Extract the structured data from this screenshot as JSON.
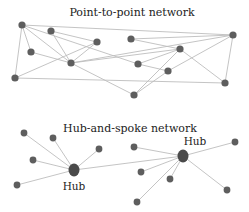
{
  "colors": {
    "node": "#5e5e5e",
    "hub": "#4a4a4a",
    "edge": "#bdbdbd",
    "text": "#222222"
  },
  "point_to_point": {
    "title": "Point-to-point network",
    "nodes": [
      {
        "id": "A",
        "x": 22,
        "y": 25
      },
      {
        "id": "B",
        "x": 51,
        "y": 31
      },
      {
        "id": "C",
        "x": 97,
        "y": 42
      },
      {
        "id": "D",
        "x": 131,
        "y": 39
      },
      {
        "id": "E",
        "x": 233,
        "y": 35
      },
      {
        "id": "F",
        "x": 31,
        "y": 52
      },
      {
        "id": "G",
        "x": 71,
        "y": 63
      },
      {
        "id": "H",
        "x": 180,
        "y": 49
      },
      {
        "id": "I",
        "x": 138,
        "y": 64
      },
      {
        "id": "J",
        "x": 168,
        "y": 71
      },
      {
        "id": "K",
        "x": 15,
        "y": 78
      },
      {
        "id": "L",
        "x": 225,
        "y": 83
      },
      {
        "id": "M",
        "x": 134,
        "y": 95
      }
    ],
    "edges": [
      [
        "A",
        "E"
      ],
      [
        "A",
        "F"
      ],
      [
        "A",
        "K"
      ],
      [
        "A",
        "G"
      ],
      [
        "A",
        "I"
      ],
      [
        "B",
        "C"
      ],
      [
        "B",
        "G"
      ],
      [
        "C",
        "G"
      ],
      [
        "C",
        "K"
      ],
      [
        "D",
        "H"
      ],
      [
        "D",
        "E"
      ],
      [
        "F",
        "G"
      ],
      [
        "G",
        "H"
      ],
      [
        "G",
        "M"
      ],
      [
        "G",
        "E"
      ],
      [
        "H",
        "I"
      ],
      [
        "H",
        "M"
      ],
      [
        "H",
        "L"
      ],
      [
        "I",
        "J"
      ],
      [
        "J",
        "E"
      ],
      [
        "J",
        "M"
      ],
      [
        "K",
        "L"
      ],
      [
        "E",
        "L"
      ]
    ]
  },
  "hub_and_spoke": {
    "title": "Hub-and-spoke network",
    "hubs": [
      {
        "id": "H1",
        "label": "Hub",
        "x": 74,
        "y": 170,
        "label_x": 74,
        "label_y": 190
      },
      {
        "id": "H2",
        "label": "Hub",
        "x": 183,
        "y": 156,
        "label_x": 195,
        "label_y": 145
      }
    ],
    "spokes": [
      {
        "hub": "H1",
        "x": 24,
        "y": 133
      },
      {
        "hub": "H1",
        "x": 53,
        "y": 138
      },
      {
        "hub": "H1",
        "x": 99,
        "y": 149
      },
      {
        "hub": "H1",
        "x": 33,
        "y": 160
      },
      {
        "hub": "H1",
        "x": 17,
        "y": 185
      },
      {
        "hub": "H2",
        "x": 134,
        "y": 147
      },
      {
        "hub": "H2",
        "x": 235,
        "y": 142
      },
      {
        "hub": "H2",
        "x": 141,
        "y": 172
      },
      {
        "hub": "H2",
        "x": 170,
        "y": 179
      },
      {
        "hub": "H2",
        "x": 227,
        "y": 190
      },
      {
        "hub": "H2",
        "x": 137,
        "y": 202
      }
    ],
    "hub_link": [
      "H1",
      "H2"
    ]
  }
}
